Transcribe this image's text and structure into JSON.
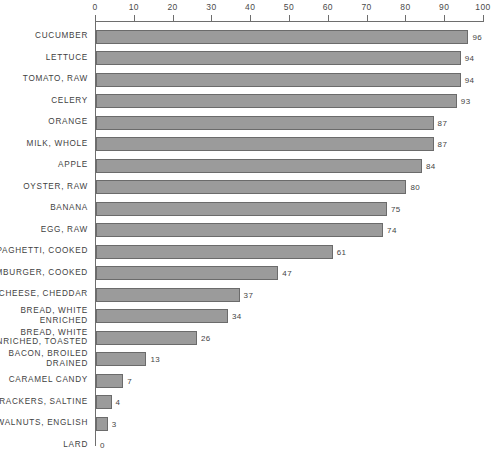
{
  "chart_data": {
    "type": "bar",
    "orientation": "horizontal",
    "title": "",
    "xlabel": "",
    "ylabel": "",
    "xlim": [
      0,
      100
    ],
    "grid": false,
    "legend": null,
    "tick_labels": [
      "0",
      "10",
      "20",
      "30",
      "40",
      "50",
      "60",
      "70",
      "80",
      "90",
      "100"
    ],
    "tick_values": [
      0,
      10,
      20,
      30,
      40,
      50,
      60,
      70,
      80,
      90,
      100
    ],
    "categories": [
      "CUCUMBER",
      "LETTUCE",
      "TOMATO, RAW",
      "CELERY",
      "ORANGE",
      "MILK, WHOLE",
      "APPLE",
      "OYSTER, RAW",
      "BANANA",
      "EGG, RAW",
      "SPAGHETTI, COOKED",
      "HAMBURGER, COOKED",
      "CHEESE, CHEDDAR",
      "BREAD, WHITE\nENRICHED",
      "BREAD, WHITE\nENRICHED, TOASTED",
      "BACON, BROILED\nDRAINED",
      "CARAMEL CANDY",
      "CRACKERS, SALTINE",
      "WALNUTS, ENGLISH",
      "LARD"
    ],
    "values": [
      96,
      94,
      94,
      93,
      87,
      87,
      84,
      80,
      75,
      74,
      61,
      47,
      37,
      34,
      26,
      13,
      7,
      4,
      3,
      0
    ],
    "value_labels": [
      "96",
      "94",
      "94",
      "93",
      "87",
      "87",
      "84",
      "80",
      "75",
      "74",
      "61",
      "47",
      "37",
      "34",
      "26",
      "13",
      "7",
      "4",
      "3",
      "0"
    ],
    "bar_color": "#9b9b9b",
    "bar_border_color": "#6b6b6b",
    "axis_color": "#6e6e6e",
    "text_color": "#3f3f3f"
  }
}
